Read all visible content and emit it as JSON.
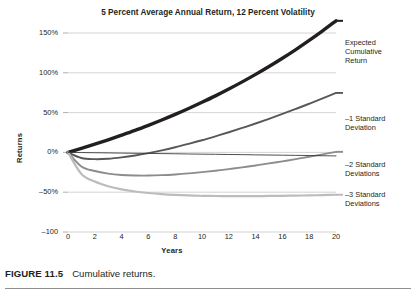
{
  "figure": {
    "caption_number": "FIGURE 11.5",
    "caption_text": "Cumulative returns."
  },
  "chart_data": {
    "type": "line",
    "title": "5 Percent Average Annual Return, 12 Percent Volatility",
    "xlabel": "Years",
    "ylabel": "Returns",
    "xlim": [
      0,
      20
    ],
    "ylim": [
      -100,
      150
    ],
    "grid": true,
    "legend_position": "right-inline-annotations",
    "x_ticks": [
      0,
      2,
      4,
      6,
      8,
      10,
      12,
      14,
      16,
      18,
      20
    ],
    "x_tick_labels": [
      "0",
      "2",
      "4",
      "6",
      "8",
      "10",
      "12",
      "14",
      "16",
      "18",
      "20"
    ],
    "y_ticks": [
      150,
      100,
      50,
      0,
      -50,
      -100
    ],
    "y_tick_labels": [
      "150%",
      "100%",
      "50%",
      "0%",
      "-50%",
      "-100"
    ],
    "x": [
      0,
      1,
      2,
      3,
      4,
      5,
      6,
      7,
      8,
      9,
      10,
      11,
      12,
      13,
      14,
      15,
      16,
      17,
      18,
      19,
      20
    ],
    "series": [
      {
        "name": "Expected Cumulative Return",
        "label": "Expected\nCumulative\nReturn",
        "color": "#231f20",
        "width": 3.4,
        "values": [
          0,
          5,
          10.3,
          15.8,
          21.6,
          27.6,
          34.0,
          40.7,
          47.7,
          55.1,
          62.9,
          71.0,
          79.6,
          88.6,
          98.0,
          107.9,
          118.3,
          129.2,
          140.7,
          152.7,
          165.3
        ],
        "annotation_y_px": 38
      },
      {
        "name": "-1 Standard Deviation",
        "label": "-1 Standard\nDeviation",
        "color": "#58585b",
        "width": 1.9,
        "values": [
          0,
          -7.0,
          -8.5,
          -8.0,
          -6.3,
          -3.9,
          -0.9,
          2.6,
          6.5,
          10.8,
          15.3,
          20.2,
          25.3,
          30.7,
          36.3,
          42.2,
          48.3,
          54.6,
          61.1,
          67.8,
          74.7
        ],
        "annotation_y_px": 114
      },
      {
        "name": "-2 Standard Deviations",
        "label": "-2 Standard\nDeviations",
        "color": "#8c8c8e",
        "width": 1.9,
        "values": [
          0,
          -17.6,
          -23.4,
          -26.6,
          -28.3,
          -29.0,
          -29.1,
          -28.6,
          -27.7,
          -26.4,
          -24.8,
          -23.0,
          -21.0,
          -18.8,
          -16.4,
          -13.8,
          -11.2,
          -8.4,
          -5.5,
          -2.4,
          0.7
        ],
        "annotation_y_px": 160
      },
      {
        "name": "-3 Standard Deviations",
        "label": "-3 Standard\nDeviations",
        "color": "#bcbcbe",
        "width": 2.2,
        "values": [
          0,
          -27.0,
          -36.6,
          -42.5,
          -46.4,
          -49.1,
          -51.0,
          -52.4,
          -53.4,
          -54.1,
          -54.5,
          -54.8,
          -54.9,
          -54.9,
          -54.9,
          -54.7,
          -54.5,
          -54.3,
          -54.0,
          -53.6,
          -53.2
        ],
        "annotation_y_px": 190
      },
      {
        "name": "zero-reference-line",
        "label": "",
        "color": "#3a3a3c",
        "width": 0.9,
        "values": [
          0,
          -0.2,
          -0.4,
          -0.6,
          -0.9,
          -1.1,
          -1.3,
          -1.5,
          -1.7,
          -2.0,
          -2.2,
          -2.4,
          -2.6,
          -2.8,
          -3.1,
          -3.3,
          -3.5,
          -3.7,
          -3.9,
          -4.2,
          -4.4
        ],
        "annotation_y_px": null
      }
    ]
  }
}
